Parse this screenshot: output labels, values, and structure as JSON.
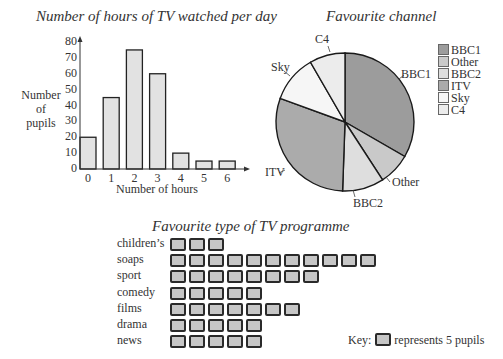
{
  "chart_data": [
    {
      "type": "bar",
      "title": "Number of hours of TV watched per day",
      "xlabel": "Number of hours",
      "ylabel": "Number of pupils",
      "categories": [
        "0",
        "1",
        "2",
        "3",
        "4",
        "5",
        "6"
      ],
      "values": [
        20,
        45,
        75,
        60,
        10,
        5,
        5
      ],
      "yticks": [
        0,
        10,
        20,
        30,
        40,
        50,
        60,
        70,
        80
      ],
      "ylim": [
        0,
        80
      ],
      "grid": false,
      "bar_color": "#e2e2e2"
    },
    {
      "type": "pie",
      "title": "Favourite channel",
      "unit": "degrees",
      "slices": [
        {
          "label": "BBC1",
          "value": 120,
          "color": "#9c9c9c"
        },
        {
          "label": "Other",
          "value": 27,
          "color": "#c9c9c9"
        },
        {
          "label": "BBC2",
          "value": 35,
          "color": "#dedede"
        },
        {
          "label": "ITV",
          "value": 108,
          "color": "#ababab"
        },
        {
          "label": "Sky",
          "value": 40,
          "color": "#f6f6f6"
        },
        {
          "label": "C4",
          "value": 30,
          "color": "#ececec"
        }
      ],
      "legend": [
        "BBC1",
        "Other",
        "BBC2",
        "ITV",
        "Sky",
        "C4"
      ],
      "legend_position": "right"
    },
    {
      "type": "pictogram",
      "title": "Favourite type of TV programme",
      "categories": [
        "children's",
        "soaps",
        "sport",
        "comedy",
        "films",
        "drama",
        "news"
      ],
      "icons": [
        3,
        11,
        8,
        5,
        7,
        5,
        5
      ],
      "values": [
        15,
        55,
        40,
        25,
        35,
        25,
        25
      ],
      "key": {
        "label": "Key:",
        "text": "represents 5 pupils",
        "value_per_icon": 5
      }
    }
  ],
  "bar": {
    "title": "Number of hours of TV watched per day",
    "ylabel_lines": [
      "Number",
      "of",
      "pupils"
    ],
    "xlabel": "Number of hours",
    "yticks": [
      "0",
      "10",
      "20",
      "30",
      "40",
      "50",
      "60",
      "70",
      "80"
    ],
    "xticks": [
      "0",
      "1",
      "2",
      "3",
      "4",
      "5",
      "6"
    ]
  },
  "pie": {
    "title": "Favourite channel",
    "labels": {
      "bbc1": "BBC1",
      "other": "Other",
      "bbc2": "BBC2",
      "itv": "ITV",
      "sky": "Sky",
      "c4": "C4"
    },
    "legend": [
      {
        "label": "BBC1",
        "color": "#9c9c9c"
      },
      {
        "label": "Other",
        "color": "#c9c9c9"
      },
      {
        "label": "BBC2",
        "color": "#dedede"
      },
      {
        "label": "ITV",
        "color": "#ababab"
      },
      {
        "label": "Sky",
        "color": "#f6f6f6"
      },
      {
        "label": "C4",
        "color": "#ececec"
      }
    ]
  },
  "pictogram": {
    "title": "Favourite type of TV programme",
    "rows": [
      {
        "label": "children’s",
        "count": 3
      },
      {
        "label": "soaps",
        "count": 11
      },
      {
        "label": "sport",
        "count": 8
      },
      {
        "label": "comedy",
        "count": 5
      },
      {
        "label": "films",
        "count": 7
      },
      {
        "label": "drama",
        "count": 5
      },
      {
        "label": "news",
        "count": 5
      }
    ],
    "key_label": "Key:",
    "key_text": "represents 5 pupils"
  }
}
